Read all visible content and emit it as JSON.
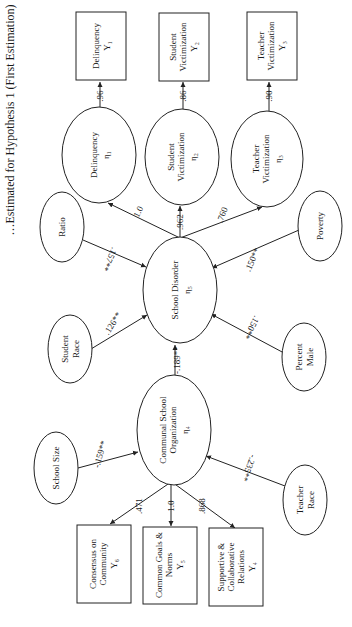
{
  "title": "…Estimated for Hypothesis 1 (First Estimation)",
  "orientation": "rotated 90° counter-clockwise",
  "nodes": {
    "delinquency_box": {
      "lines": [
        "Delinquency",
        "Y₁"
      ],
      "shape": "box"
    },
    "student_vict_box": {
      "lines": [
        "Student",
        "Victimization",
        "Y₂"
      ],
      "shape": "box"
    },
    "teacher_vict_box": {
      "lines": [
        "Teacher",
        "Victimization",
        "Y₃"
      ],
      "shape": "box"
    },
    "delinquency_eta": {
      "lines": [
        "Delinquency",
        "η₁"
      ],
      "shape": "ellipse"
    },
    "student_vict_eta": {
      "lines": [
        "Student",
        "Victimization",
        "η₂"
      ],
      "shape": "ellipse"
    },
    "teacher_vict_eta": {
      "lines": [
        "Teacher",
        "Victimization",
        "η₃"
      ],
      "shape": "ellipse"
    },
    "ratio": {
      "lines": [
        "Ratio"
      ],
      "shape": "ellipse"
    },
    "poverty": {
      "lines": [
        "Poverty"
      ],
      "shape": "ellipse"
    },
    "school_disorder": {
      "lines": [
        "School Disorder",
        "η₅"
      ],
      "shape": "ellipse"
    },
    "student_race": {
      "lines": [
        "Student",
        "Race"
      ],
      "shape": "ellipse"
    },
    "percent_male": {
      "lines": [
        "Percent",
        "Male"
      ],
      "shape": "ellipse"
    },
    "communal_org": {
      "lines": [
        "Communal School",
        "Organization",
        "η₄"
      ],
      "shape": "ellipse"
    },
    "school_size": {
      "lines": [
        "School Size"
      ],
      "shape": "ellipse"
    },
    "teacher_race": {
      "lines": [
        "Teacher",
        "Race"
      ],
      "shape": "ellipse"
    },
    "consensus_box": {
      "lines": [
        "Consensus on",
        "Community",
        "Y₆"
      ],
      "shape": "box"
    },
    "common_goals_box": {
      "lines": [
        "Common Goals &",
        "Norms",
        "Y₅"
      ],
      "shape": "box"
    },
    "supportive_box": {
      "lines": [
        "Supportive &",
        "Collaborative",
        "Relations",
        "Y₄"
      ],
      "shape": "box"
    }
  },
  "edges": [
    {
      "from": "delinquency_eta",
      "to": "delinquency_box",
      "coef": ".96"
    },
    {
      "from": "student_vict_eta",
      "to": "student_vict_box",
      "coef": ".86"
    },
    {
      "from": "teacher_vict_eta",
      "to": "teacher_vict_box",
      "coef": ".90"
    },
    {
      "from": "school_disorder",
      "to": "delinquency_eta",
      "coef": "1.0"
    },
    {
      "from": "school_disorder",
      "to": "student_vict_eta",
      "coef": ".962"
    },
    {
      "from": "school_disorder",
      "to": "teacher_vict_eta",
      "coef": ".760"
    },
    {
      "from": "ratio",
      "to": "school_disorder",
      "coef": ".157**"
    },
    {
      "from": "poverty",
      "to": "school_disorder",
      "coef": ".150**"
    },
    {
      "from": "student_race",
      "to": "school_disorder",
      "coef": ".126**"
    },
    {
      "from": "percent_male",
      "to": "school_disorder",
      "coef": ".150**"
    },
    {
      "from": "communal_org",
      "to": "school_disorder",
      "coef": "-.189**"
    },
    {
      "from": "school_size",
      "to": "communal_org",
      "coef": "-.159**"
    },
    {
      "from": "teacher_race",
      "to": "communal_org",
      "coef": "-.235**"
    },
    {
      "from": "communal_org",
      "to": "consensus_box",
      "coef": ".471"
    },
    {
      "from": "communal_org",
      "to": "common_goals_box",
      "coef": "1.0"
    },
    {
      "from": "communal_org",
      "to": "supportive_box",
      "coef": ".868"
    }
  ]
}
